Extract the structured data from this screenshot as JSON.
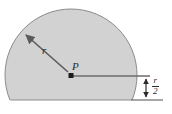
{
  "figure": {
    "background_color": "#ffffff",
    "shape": {
      "name": "truncated-circle",
      "fill_color": "#d2d2d2",
      "stroke_color": "#8c8c8c",
      "center_x": 71,
      "center_y": 75,
      "radius": 66,
      "chord_offset_below_center": 25,
      "chord_y": 100,
      "top_y": 9,
      "left_x": 5,
      "right_x": 137
    },
    "center_point": {
      "label": "P",
      "x": 71,
      "y": 75,
      "dot_color": "#1a1a1a",
      "dot_size": 5
    },
    "radius_arrow": {
      "label": "r",
      "from_x": 71,
      "from_y": 75,
      "to_x": 24,
      "to_y": 33,
      "line_color": "#5a5a5a",
      "label_x": 47,
      "label_y": 52
    },
    "horizontal_leader": {
      "from_x": 71,
      "from_y": 76,
      "to_x": 150,
      "to_y": 76,
      "line_color": "#6b6b6b"
    },
    "baseline_leader": {
      "from_x": 137,
      "from_y": 100,
      "to_x": 163,
      "to_y": 100,
      "line_color": "#6b6b6b"
    },
    "dimension": {
      "label_numerator": "r",
      "label_denominator": "2",
      "label_text": "r/2",
      "x": 146,
      "top_y": 76,
      "bottom_y": 100,
      "line_color": "#2b2b2b"
    }
  }
}
